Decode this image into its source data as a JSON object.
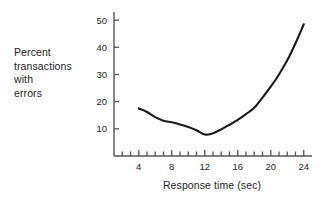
{
  "chart_data": {
    "type": "line",
    "title": "",
    "subtitle": "",
    "xlabel": "Response time (sec)",
    "ylabel": "Percent transactions with errors",
    "ylabel_lines": [
      "Percent",
      "transactions",
      "with",
      "errors"
    ],
    "xlim": [
      1,
      25
    ],
    "ylim": [
      0,
      53
    ],
    "xticks": [
      4,
      8,
      12,
      16,
      20,
      24
    ],
    "xtick_labels": [
      "4",
      "8",
      "12",
      "16",
      "20",
      "24"
    ],
    "xminor_ticks": [
      2,
      3,
      4,
      5,
      6,
      7,
      8,
      9,
      10,
      11,
      12,
      13,
      14,
      15,
      16,
      17,
      18,
      19,
      20,
      21,
      22,
      23,
      24
    ],
    "yticks": [
      10,
      20,
      30,
      40,
      50
    ],
    "ytick_labels": [
      "10",
      "20",
      "30",
      "40",
      "50"
    ],
    "grid": false,
    "legend": "none",
    "line_color": "#1a1a1a",
    "axis_color": "#555555",
    "x": [
      4,
      5,
      6,
      7,
      8,
      9,
      10,
      11,
      12,
      13,
      14,
      15,
      16,
      17,
      18,
      19,
      20,
      21,
      22,
      23,
      24
    ],
    "values": [
      17.5,
      16.2,
      14.3,
      13.0,
      12.4,
      11.6,
      10.7,
      9.5,
      7.9,
      8.4,
      9.8,
      11.5,
      13.3,
      15.4,
      17.8,
      21.5,
      25.5,
      30.0,
      35.2,
      41.5,
      48.5
    ],
    "series": [
      {
        "name": "Percent transactions with errors",
        "values": [
          17.5,
          16.2,
          14.3,
          13.0,
          12.4,
          11.6,
          10.7,
          9.5,
          7.9,
          8.4,
          9.8,
          11.5,
          13.3,
          15.4,
          17.8,
          21.5,
          25.5,
          30.0,
          35.2,
          41.5,
          48.5
        ]
      }
    ],
    "annotations": []
  }
}
